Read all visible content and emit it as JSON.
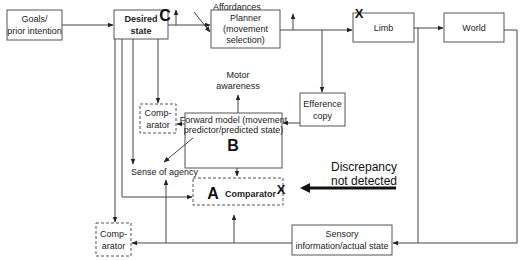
{
  "nodes": {
    "goals": {
      "line1": "Goals/",
      "line2": "prior intention"
    },
    "desired_state": {
      "line1": "Desired",
      "line2": "state"
    },
    "planner": {
      "line1": "Planner",
      "line2": "(movement",
      "line3": "selection)"
    },
    "limb": {
      "label": "Limb"
    },
    "world": {
      "label": "World"
    },
    "efference_copy": {
      "line1": "Efference",
      "line2": "copy"
    },
    "forward_model": {
      "line1": "Forward model (movement",
      "line2": "predictor/predicted state)",
      "marker": "B"
    },
    "comparator_top": {
      "line1": "Comp-",
      "line2": "arator"
    },
    "comparator_a": {
      "marker": "A",
      "label": "Comparator",
      "x_mark": "X"
    },
    "sensory": {
      "line1": "Sensory",
      "line2": "information/actual state"
    },
    "comparator_bottom": {
      "line1": "Comp-",
      "line2": "arator"
    }
  },
  "labels": {
    "affordances": "Affordances",
    "motor_awareness_1": "Motor",
    "motor_awareness_2": "awareness",
    "sense_of_agency": "Sense of agency",
    "marker_c": "C",
    "limb_x_mark": "X",
    "discrepancy_1": "Discrepancy",
    "discrepancy_2": "not detected"
  }
}
